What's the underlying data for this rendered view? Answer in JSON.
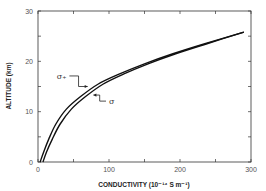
{
  "chart_data": {
    "type": "line",
    "title": "",
    "xlabel": "CONDUCTIVITY (10⁻¹⁴ S m⁻¹)",
    "ylabel": "ALTITUDE (km)",
    "xlim": [
      0,
      300
    ],
    "ylim": [
      0,
      30
    ],
    "xticks": [
      0,
      100,
      200,
      300
    ],
    "yticks": [
      0,
      10,
      20,
      30
    ],
    "grid": false,
    "legend": "inline labels with arrows",
    "series": [
      {
        "name": "σ₊",
        "x": [
          3,
          8,
          15,
          25,
          40,
          60,
          85,
          115,
          150,
          190,
          235,
          290
        ],
        "y": [
          0,
          2,
          4.5,
          7.5,
          10.5,
          13,
          15.5,
          17.5,
          19.5,
          21.5,
          23.5,
          25.8
        ]
      },
      {
        "name": "σ",
        "x": [
          7,
          12,
          20,
          31,
          47,
          67,
          92,
          121,
          155,
          194,
          238,
          290
        ],
        "y": [
          0,
          2,
          4.5,
          7.5,
          10.5,
          13,
          15.5,
          17.5,
          19.5,
          21.5,
          23.5,
          25.8
        ]
      }
    ],
    "annotations": [
      {
        "text": "σ₊",
        "x": 40,
        "y": 16.5,
        "arrow_to": [
          70,
          15
        ]
      },
      {
        "text": "σ",
        "x": 100,
        "y": 11.5,
        "arrow_to": [
          78,
          13.3
        ]
      }
    ]
  }
}
